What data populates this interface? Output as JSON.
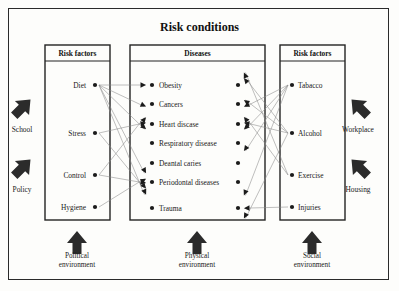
{
  "title": "Risk conditions",
  "columns": {
    "left": {
      "header": "Risk factors",
      "items": [
        "Diet",
        "Stress",
        "Control",
        "Hygiene"
      ]
    },
    "middle": {
      "header": "Diseases",
      "items": [
        "Obesity",
        "Cancers",
        "Heart discase",
        "Respiratory disease",
        "Deantal caries",
        "Periodontal diseases",
        "Trauma"
      ]
    },
    "right": {
      "header": "Risk factors",
      "items": [
        "Tabacco",
        "Alcohol",
        "Exercise",
        "Injuries"
      ]
    }
  },
  "side_labels": {
    "left": [
      "School",
      "Policy"
    ],
    "right": [
      "Workplace",
      "Housing"
    ]
  },
  "bottom_labels": [
    {
      "line1": "Political",
      "line2": "environment"
    },
    {
      "line1": "Physical",
      "line2": "environment"
    },
    {
      "line1": "Social",
      "line2": "environment"
    }
  ],
  "chart_data": {
    "type": "diagram",
    "title": "Risk conditions",
    "node_geometry": {
      "left_dot_x": 95,
      "left_label_anchor_x": 90,
      "mid_dot_left_x": 152,
      "mid_dot_right_x": 238,
      "mid_label_x": 157,
      "right_dot_x": 292,
      "right_label_x": 298,
      "left_rows": [
        85,
        133,
        175,
        207
      ],
      "middle_rows": [
        85,
        104,
        124,
        143,
        163,
        182,
        208
      ],
      "right_rows": [
        85,
        133,
        175,
        207
      ]
    },
    "boxes": [
      {
        "name": "left-column",
        "x": 45,
        "y": 45,
        "w": 65,
        "h": 175,
        "header_h": 16
      },
      {
        "name": "middle-column",
        "x": 130,
        "y": 45,
        "w": 135,
        "h": 175,
        "header_h": 16
      },
      {
        "name": "right-column",
        "x": 280,
        "y": 45,
        "w": 65,
        "h": 175,
        "header_h": 16
      }
    ],
    "edges": [
      {
        "from": "Diet",
        "to": "Obesity"
      },
      {
        "from": "Diet",
        "to": "Cancers"
      },
      {
        "from": "Diet",
        "to": "Heart discase"
      },
      {
        "from": "Diet",
        "to": "Deantal caries"
      },
      {
        "from": "Diet",
        "to": "Periodontal diseases"
      },
      {
        "from": "Stress",
        "to": "Heart discase"
      },
      {
        "from": "Stress",
        "to": "Periodontal diseases"
      },
      {
        "from": "Control",
        "to": "Heart discase"
      },
      {
        "from": "Control",
        "to": "Periodontal diseases"
      },
      {
        "from": "Hygiene",
        "to": "Periodontal diseases"
      },
      {
        "from": "Tabacco",
        "to": "Cancers"
      },
      {
        "from": "Tabacco",
        "to": "Heart discase"
      },
      {
        "from": "Tabacco",
        "to": "Respiratory disease"
      },
      {
        "from": "Tabacco",
        "to": "Periodontal diseases"
      },
      {
        "from": "Alcohol",
        "to": "Obesity"
      },
      {
        "from": "Alcohol",
        "to": "Cancers"
      },
      {
        "from": "Alcohol",
        "to": "Heart discase"
      },
      {
        "from": "Alcohol",
        "to": "Trauma"
      },
      {
        "from": "Exercise",
        "to": "Obesity"
      },
      {
        "from": "Exercise",
        "to": "Heart discase"
      },
      {
        "from": "Injuries",
        "to": "Trauma"
      }
    ],
    "side_arrows": [
      {
        "label": "School",
        "direction": "up-right",
        "x": 22,
        "y": 108
      },
      {
        "label": "Policy",
        "direction": "up-right",
        "x": 22,
        "y": 168
      },
      {
        "label": "Workplace",
        "direction": "up-left",
        "x": 360,
        "y": 108
      },
      {
        "label": "Housing",
        "direction": "up-left",
        "x": 360,
        "y": 168
      }
    ],
    "bottom_arrows": [
      {
        "label": "Political environment",
        "direction": "up",
        "x": 77
      },
      {
        "label": "Physical environment",
        "direction": "up",
        "x": 197
      },
      {
        "label": "Social environment",
        "direction": "up",
        "x": 312
      }
    ]
  }
}
